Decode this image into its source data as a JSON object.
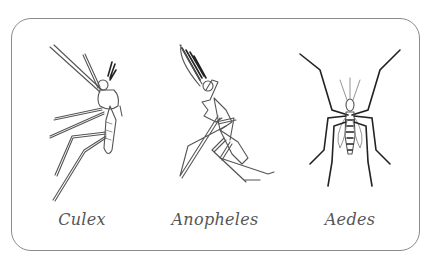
{
  "diagram": {
    "title": "",
    "panels": [
      {
        "id": "culex",
        "label": "Culex",
        "icon": "culex-mosquito-side-view"
      },
      {
        "id": "anopheles",
        "label": "Anopheles",
        "icon": "anopheles-mosquito-side-view"
      },
      {
        "id": "aedes",
        "label": "Aedes",
        "icon": "aedes-mosquito-top-view"
      }
    ],
    "colors": {
      "border": "#8a8a8a",
      "label": "#555555",
      "line": "#555555"
    }
  }
}
